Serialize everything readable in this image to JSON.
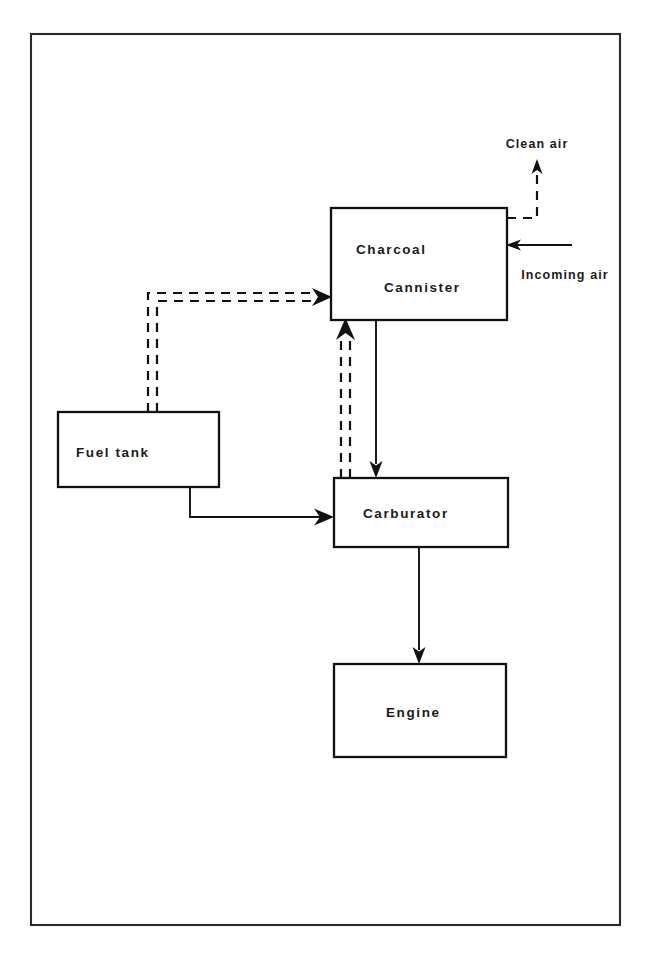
{
  "diagram": {
    "nodes": [
      {
        "id": "charcoal_cannister",
        "label_line1": "Charcoal",
        "label_line2": "Cannister",
        "x": 331,
        "y": 208,
        "w": 176,
        "h": 112
      },
      {
        "id": "fuel_tank",
        "label_line1": "Fuel tank",
        "label_line2": "",
        "x": 58,
        "y": 412,
        "w": 161,
        "h": 75
      },
      {
        "id": "carburator",
        "label_line1": "Carburator",
        "label_line2": "",
        "x": 334,
        "y": 478,
        "w": 174,
        "h": 69
      },
      {
        "id": "engine",
        "label_line1": "Engine",
        "label_line2": "",
        "x": 334,
        "y": 664,
        "w": 172,
        "h": 93
      }
    ],
    "flow_labels": [
      {
        "id": "clean_air",
        "text": "Clean air",
        "x": 537,
        "y": 148
      },
      {
        "id": "incoming_air",
        "text": "Incoming air",
        "x": 565,
        "y": 279
      }
    ],
    "frame": {
      "x": 31,
      "y": 34,
      "w": 589,
      "h": 891
    },
    "connections": [
      {
        "id": "clean-air-vent",
        "style": "dashed",
        "from": "charcoal_cannister",
        "to": "clean_air"
      },
      {
        "id": "incoming-air-inlet",
        "style": "solid",
        "from": "incoming_air",
        "to": "charcoal_cannister"
      },
      {
        "id": "fuel-tank-vapor-to-cannister",
        "style": "dashed",
        "from": "fuel_tank",
        "to": "charcoal_cannister"
      },
      {
        "id": "cannister-purge-to-carburator",
        "style": "solid",
        "from": "charcoal_cannister",
        "to": "carburator"
      },
      {
        "id": "carburator-vapor-to-cannister",
        "style": "dashed",
        "from": "carburator",
        "to": "charcoal_cannister"
      },
      {
        "id": "fuel-tank-to-carburator",
        "style": "solid",
        "from": "fuel_tank",
        "to": "carburator"
      },
      {
        "id": "carburator-to-engine",
        "style": "solid",
        "from": "carburator",
        "to": "engine"
      }
    ]
  },
  "colors": {
    "ink": "#111111",
    "frame": "#2a2a2a",
    "background": "#ffffff"
  }
}
